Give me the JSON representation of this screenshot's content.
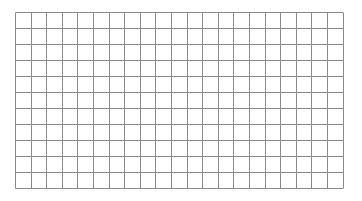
{
  "grid": {
    "columns": 21,
    "rows": 11,
    "cell_width": 15.6,
    "cell_height": 16,
    "line_color": "#8a8a8a",
    "border_color": "#d0d0d0",
    "background": "#ffffff"
  }
}
